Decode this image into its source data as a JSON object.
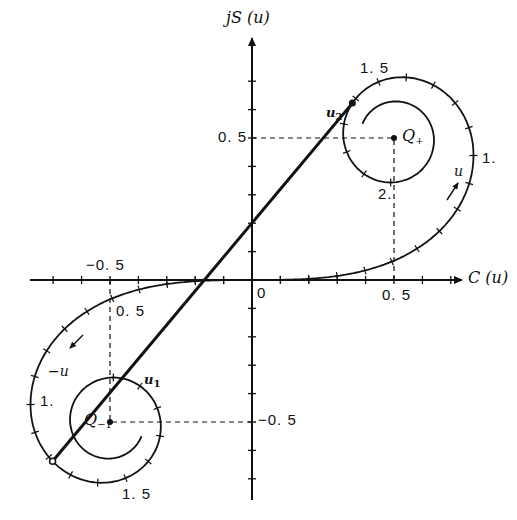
{
  "figure": {
    "axes": {
      "x_label": "C (u)",
      "y_label": "jS (u)",
      "origin_label": "0",
      "origin_px": [
        252,
        280
      ],
      "px_per_unit": 284,
      "tick_step": 0.1,
      "x_range": [
        -0.8,
        0.8
      ],
      "y_range": [
        -0.8,
        0.8
      ]
    },
    "tick_labels": {
      "x_pos_half": "0. 5",
      "x_neg_half": "−0. 5",
      "y_pos_half": "0. 5",
      "y_neg_half": "−0. 5"
    },
    "points": {
      "Q_plus": {
        "label": "Q",
        "sub": "+",
        "coords": [
          0.5,
          0.5
        ]
      },
      "Q_minus": {
        "label": "Q",
        "sub": "−1",
        "coords": [
          -0.5,
          -0.5
        ]
      },
      "u1": {
        "label": "u",
        "sub": "1",
        "param": -1.22
      },
      "u2": {
        "label": "u",
        "sub": "2",
        "param": 1.62
      }
    },
    "curve_labels": {
      "pos_1": "1.",
      "pos_1_5": "1. 5",
      "pos_2": "2.",
      "pos_0_5": "0. 5",
      "neg_1": "1.",
      "neg_1_5": "1. 5",
      "dir_pos": "u",
      "dir_neg": "−u"
    },
    "spiral": {
      "u_max": 2.6,
      "tick_every": 0.1
    },
    "colors": {
      "ink": "#111111",
      "background": "#ffffff"
    }
  }
}
